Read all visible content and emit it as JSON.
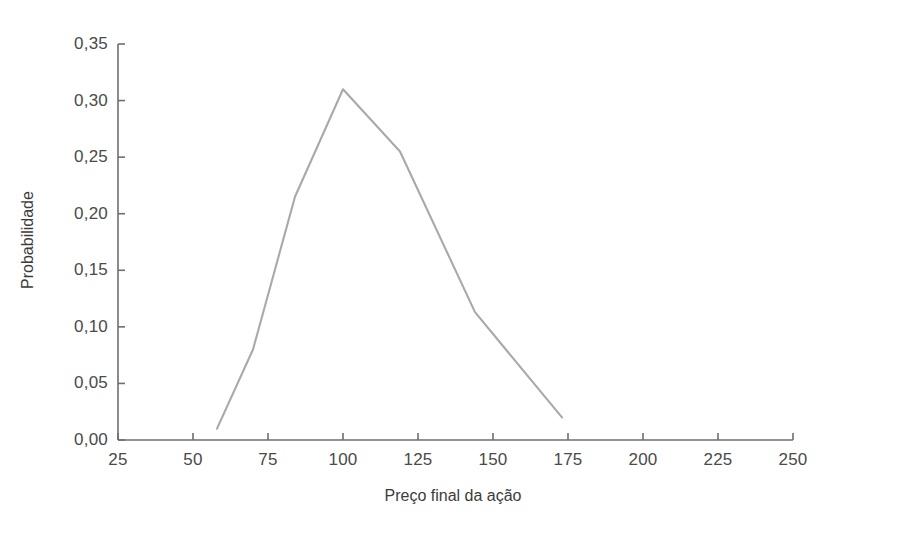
{
  "chart_data": {
    "type": "line",
    "title": "",
    "subtitle": "",
    "xlabel": "Preço final da ação",
    "ylabel": "Probabilidade",
    "xlim": [
      25,
      250
    ],
    "ylim": [
      0.0,
      0.35
    ],
    "grid": false,
    "legend": null,
    "legend_position": "none",
    "line_color": "#a9a9a9",
    "axis_color": "#6e6e6e",
    "text_color": "#4a4a4a",
    "x_ticks": [
      25,
      50,
      75,
      100,
      125,
      150,
      175,
      200,
      225,
      250
    ],
    "x_tick_labels": [
      "25",
      "50",
      "75",
      "100",
      "125",
      "150",
      "175",
      "200",
      "225",
      "250"
    ],
    "y_ticks": [
      0.0,
      0.05,
      0.1,
      0.15,
      0.2,
      0.25,
      0.3,
      0.35
    ],
    "y_tick_labels": [
      "0,00",
      "0,05",
      "0,10",
      "0,15",
      "0,20",
      "0,25",
      "0,30",
      "0,35"
    ],
    "series": [
      {
        "name": "Probabilidade",
        "x": [
          58,
          70,
          84,
          100,
          119,
          144,
          173
        ],
        "values": [
          0.01,
          0.08,
          0.215,
          0.31,
          0.255,
          0.113,
          0.02
        ]
      }
    ]
  },
  "axes": {
    "x_title": "Preço final da ação",
    "y_title": "Probabilidade"
  }
}
